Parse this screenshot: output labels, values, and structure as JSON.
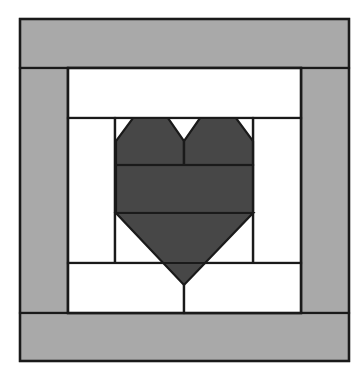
{
  "figure": {
    "kind": "quilt-block-diagram",
    "title": "Heart quilt block piecing diagram",
    "canvas": {
      "width": 364,
      "height": 371,
      "background": "#ffffff"
    }
  },
  "palette": {
    "background": "#ffffff",
    "border_fabric": "#a9a9a9",
    "heart_fabric": "#474747",
    "light_fabric": "#ffffff",
    "seam_line": "#1a1a1a"
  },
  "block": {
    "outer_frame": {
      "x": 20,
      "y": 19,
      "width": 329,
      "height": 342
    },
    "border_strip_width_top": 49,
    "border_strip_width_left": 48,
    "border_strip_width_right": 48,
    "border_strip_width_bottom": 48,
    "inner_field": {
      "x": 68,
      "y": 68,
      "width": 233,
      "height": 245
    }
  },
  "pieces": [
    {
      "name": "outer-border-top",
      "fabric": "border_fabric"
    },
    {
      "name": "outer-border-left",
      "fabric": "border_fabric"
    },
    {
      "name": "outer-border-right",
      "fabric": "border_fabric"
    },
    {
      "name": "outer-border-bottom",
      "fabric": "border_fabric"
    },
    {
      "name": "top-background-strip",
      "fabric": "light_fabric"
    },
    {
      "name": "left-side-strip",
      "fabric": "light_fabric"
    },
    {
      "name": "right-side-strip",
      "fabric": "light_fabric"
    },
    {
      "name": "bottom-left-strip",
      "fabric": "light_fabric"
    },
    {
      "name": "bottom-right-strip",
      "fabric": "light_fabric"
    },
    {
      "name": "heart-left-lobe",
      "fabric": "heart_fabric"
    },
    {
      "name": "heart-right-lobe",
      "fabric": "heart_fabric"
    },
    {
      "name": "heart-middle-band",
      "fabric": "heart_fabric"
    },
    {
      "name": "heart-lower-point",
      "fabric": "heart_fabric"
    }
  ],
  "geometry": {
    "heart": {
      "left": 116,
      "right": 253,
      "top": 118,
      "center_x": 184,
      "lobe_seam_y": 165,
      "band_bottom_y": 213,
      "point_bottom_y": 285,
      "notch_drop_y": 141,
      "outer_notch_width": 17,
      "center_notch_half_width": 16,
      "lower_seam_y": 263
    },
    "seams": {
      "top_strip_bottom_y": 118,
      "heart_panel_left_x": 115,
      "heart_panel_right_x": 253,
      "bottom_strip_top_y": 263,
      "center_line_x": 184
    }
  }
}
